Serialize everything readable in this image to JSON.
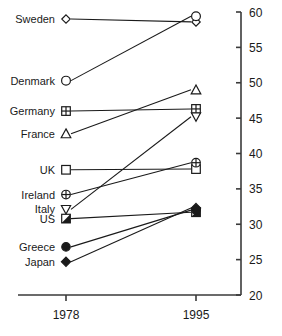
{
  "chart_data": {
    "type": "line",
    "subtype": "slope-graph",
    "title": "",
    "xlabel": "",
    "ylabel": "",
    "x": [
      "1978",
      "1995"
    ],
    "categories": [
      "1978",
      "1995"
    ],
    "ylim": [
      20,
      60
    ],
    "yticks": [
      20,
      25,
      30,
      35,
      40,
      45,
      50,
      55,
      60
    ],
    "ytick_labels": [
      "20",
      "25",
      "30",
      "35",
      "40",
      "45",
      "50",
      "55",
      "60"
    ],
    "xtick_labels": [
      "1978",
      "1995"
    ],
    "grid": false,
    "legend": "inline-left-labels",
    "axis_position": "right",
    "series": [
      {
        "name": "Sweden",
        "marker": "diamond-open",
        "values": [
          59.0,
          58.6
        ]
      },
      {
        "name": "Denmark",
        "marker": "circle-open",
        "values": [
          50.3,
          59.4
        ]
      },
      {
        "name": "Germany",
        "marker": "square-crossed",
        "values": [
          46.0,
          46.3
        ]
      },
      {
        "name": "France",
        "marker": "triangle-open",
        "values": [
          42.8,
          49.0
        ]
      },
      {
        "name": "UK",
        "marker": "square-open",
        "values": [
          37.7,
          37.8
        ]
      },
      {
        "name": "Ireland",
        "marker": "circle-crossed",
        "values": [
          34.2,
          38.7
        ]
      },
      {
        "name": "Italy",
        "marker": "triangle-down-open",
        "values": [
          32.1,
          45.2
        ]
      },
      {
        "name": "US",
        "marker": "square-half",
        "values": [
          30.8,
          31.7
        ]
      },
      {
        "name": "Greece",
        "marker": "circle-solid",
        "values": [
          26.8,
          32.0
        ]
      },
      {
        "name": "Japan",
        "marker": "diamond-solid",
        "values": [
          24.7,
          32.3
        ]
      }
    ],
    "label_positions": [
      {
        "name": "Sweden",
        "y": 59.0
      },
      {
        "name": "Denmark",
        "y": 50.3
      },
      {
        "name": "Germany",
        "y": 46.0
      },
      {
        "name": "France",
        "y": 42.8
      },
      {
        "name": "UK",
        "y": 37.7
      },
      {
        "name": "Ireland",
        "y": 34.2
      },
      {
        "name": "Italy",
        "y": 32.1
      },
      {
        "name": "US",
        "y": 30.8
      },
      {
        "name": "Greece",
        "y": 26.8
      },
      {
        "name": "Japan",
        "y": 24.7
      }
    ],
    "colors": {
      "line": "#1a1a1a",
      "axis": "#3a3a3a",
      "background": "#ffffff"
    }
  }
}
